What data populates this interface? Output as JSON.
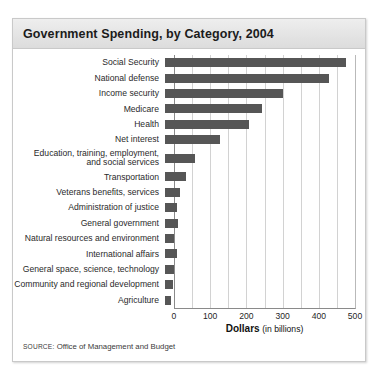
{
  "card": {
    "title": "Government Spending, by Category, 2004",
    "source_keyword": "SOURCE:",
    "source_text": "Office of Management and Budget"
  },
  "axis": {
    "title_bold": "Dollars",
    "title_light": "(in billions)",
    "tick_labels": [
      "0",
      "100",
      "200",
      "300",
      "400",
      "500"
    ]
  },
  "colors": {
    "bar": "#565656",
    "gridline": "#d2d2d2",
    "axis": "#8a8a8a",
    "header_band": "#e4e4e4",
    "card_border": "#c9c9c9"
  },
  "chart_data": {
    "type": "bar",
    "orientation": "horizontal",
    "title": "Government Spending, by Category, 2004",
    "xlabel": "Dollars (in billions)",
    "ylabel": "",
    "xlim": [
      0,
      500
    ],
    "xticks": [
      0,
      100,
      200,
      300,
      400,
      500
    ],
    "minor_gridline_step": 50,
    "grid": true,
    "legend": "none",
    "units": "billions of dollars",
    "source": "SOURCE: Office of Management and Budget",
    "categories": [
      "Social Security",
      "National defense",
      "Income security",
      "Medicare",
      "Health",
      "Net interest",
      "Education, training, employment,\nand social services",
      "Transportation",
      "Veterans benefits, services",
      "Administration of justice",
      "General government",
      "Natural resources and environment",
      "International affairs",
      "General space, science, technology",
      "Community and regional development",
      "Agriculture"
    ],
    "values": [
      500,
      453,
      325,
      267,
      231,
      153,
      84,
      58,
      42,
      33,
      36,
      26,
      32,
      24,
      21,
      17
    ]
  }
}
